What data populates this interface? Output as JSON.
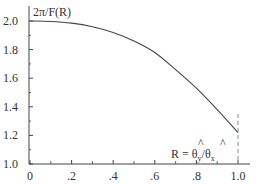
{
  "chart_data": {
    "type": "line",
    "title": "",
    "ylabel": "2π/F(R)",
    "xlabel": "",
    "annotation": "R = θ̂y/θ̂x",
    "annotation_parts": {
      "lhs": "R = ",
      "num": "θ",
      "num_sub": "y",
      "sep": "/",
      "den": "θ",
      "den_sub": "x"
    },
    "xlim": [
      0,
      1.0
    ],
    "ylim": [
      1.0,
      2.0
    ],
    "x_ticks": [
      0,
      0.2,
      0.4,
      0.6,
      0.8,
      1.0
    ],
    "x_tick_labels": [
      "0",
      ".2",
      ".4",
      ".6",
      ".8",
      "1.0"
    ],
    "y_ticks": [
      1.0,
      1.2,
      1.4,
      1.6,
      1.8,
      2.0
    ],
    "y_tick_labels": [
      "1.0",
      "1.2",
      "1.4",
      "1.6",
      "1.8",
      "2.0"
    ],
    "grid": false,
    "series": [
      {
        "name": "2π/F(R)",
        "x": [
          0.0,
          0.1,
          0.2,
          0.3,
          0.4,
          0.5,
          0.6,
          0.7,
          0.8,
          0.9,
          1.0
        ],
        "values": [
          2.0,
          1.997,
          1.985,
          1.96,
          1.92,
          1.86,
          1.78,
          1.66,
          1.53,
          1.38,
          1.22
        ]
      }
    ],
    "reference_line": {
      "x": 1.0,
      "style": "dashed"
    }
  }
}
